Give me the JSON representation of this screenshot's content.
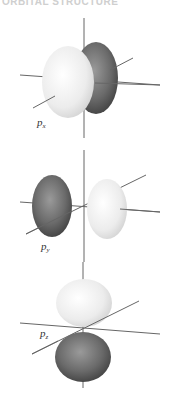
{
  "header": {
    "title": "ORBITAL STRUCTURE"
  },
  "colors": {
    "positive_lobe": "#e8e8e8",
    "negative_lobe": "#5a5a5a",
    "axis": "#555555",
    "background": "#ffffff"
  },
  "orbitals": [
    {
      "label_main": "p",
      "label_sub": "x",
      "name": "px"
    },
    {
      "label_main": "p",
      "label_sub": "y",
      "name": "py"
    },
    {
      "label_main": "p",
      "label_sub": "z",
      "name": "pz"
    }
  ]
}
